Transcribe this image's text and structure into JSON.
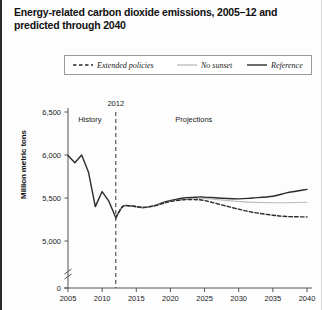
{
  "title": "Energy-related carbon dioxide emissions, 2005–12 and predicted through 2040",
  "legend": {
    "items": [
      {
        "label": "Extended policies",
        "style": "dashed",
        "color": "#2b2b2b"
      },
      {
        "label": "No sunset",
        "style": "solid-light",
        "color": "#b9b9b9"
      },
      {
        "label": "Reference",
        "style": "solid-dark",
        "color": "#2b2b2b"
      }
    ]
  },
  "annotations": {
    "history": "History",
    "divider_year": "2012",
    "projections": "Projections"
  },
  "chart_data": {
    "type": "line",
    "title": "Energy-related carbon dioxide emissions, 2005–12 and predicted through 2040",
    "xlabel": "",
    "ylabel": "Million metric tons",
    "xlim": [
      2005,
      2040
    ],
    "ylim": [
      4850,
      6500
    ],
    "ybreak": 0,
    "grid": false,
    "legend_position": "top",
    "xticks": [
      2005,
      2010,
      2015,
      2020,
      2025,
      2030,
      2035,
      2040
    ],
    "xticklabels": [
      "2005",
      "2010",
      "2015",
      "2020",
      "2025",
      "2030",
      "2035",
      "2040"
    ],
    "yticks": [
      0,
      5000,
      5500,
      6000,
      6500
    ],
    "yticklabels": [
      "0",
      "5,000",
      "5,500",
      "6,000",
      "6,500"
    ],
    "divider_x": 2012,
    "series": [
      {
        "name": "History",
        "style": "solid-dark",
        "color": "#2b2b2b",
        "x": [
          2005,
          2006,
          2007,
          2008,
          2009,
          2010,
          2011,
          2012
        ],
        "values": [
          5995,
          5910,
          6000,
          5800,
          5400,
          5575,
          5460,
          5270
        ]
      },
      {
        "name": "Reference",
        "style": "solid-dark",
        "color": "#2b2b2b",
        "x": [
          2012,
          2013,
          2014,
          2015,
          2016,
          2017,
          2018,
          2019,
          2020,
          2022,
          2024,
          2025,
          2027,
          2030,
          2032,
          2035,
          2037,
          2040
        ],
        "values": [
          5270,
          5400,
          5410,
          5400,
          5390,
          5400,
          5420,
          5450,
          5470,
          5500,
          5510,
          5510,
          5500,
          5490,
          5500,
          5520,
          5560,
          5600
        ]
      },
      {
        "name": "No sunset",
        "style": "solid-light",
        "color": "#b9b9b9",
        "x": [
          2012,
          2013,
          2014,
          2015,
          2016,
          2017,
          2018,
          2019,
          2020,
          2022,
          2024,
          2025,
          2027,
          2030,
          2032,
          2035,
          2037,
          2040
        ],
        "values": [
          5270,
          5400,
          5410,
          5400,
          5390,
          5400,
          5415,
          5440,
          5460,
          5485,
          5495,
          5495,
          5480,
          5460,
          5450,
          5445,
          5445,
          5450
        ]
      },
      {
        "name": "Extended policies",
        "style": "dashed",
        "color": "#2b2b2b",
        "x": [
          2012,
          2013,
          2014,
          2015,
          2016,
          2017,
          2018,
          2019,
          2020,
          2022,
          2024,
          2025,
          2027,
          2030,
          2032,
          2035,
          2037,
          2040
        ],
        "values": [
          5270,
          5400,
          5410,
          5400,
          5390,
          5400,
          5415,
          5440,
          5460,
          5480,
          5480,
          5470,
          5430,
          5370,
          5335,
          5300,
          5285,
          5280
        ]
      }
    ]
  }
}
